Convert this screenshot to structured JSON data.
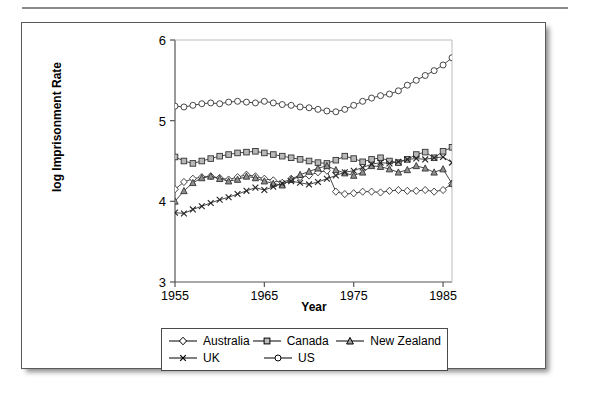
{
  "figure": {
    "has_top_rule": true,
    "frame_color": "#5a5a5a"
  },
  "chart_data": {
    "type": "line",
    "title": "",
    "xlabel": "Year",
    "ylabel": "log Imprisonment Rate",
    "xlim": [
      1955,
      1986
    ],
    "ylim": [
      3,
      6
    ],
    "xticks": [
      1955,
      1965,
      1975,
      1985
    ],
    "yticks": [
      3,
      4,
      5,
      6
    ],
    "xtick_labels": [
      "1955",
      "1965",
      "1975",
      "1985"
    ],
    "ytick_labels": [
      "3",
      "4",
      "5",
      "6"
    ],
    "grid": false,
    "legend_position": "below-plot",
    "x": [
      1955,
      1956,
      1957,
      1958,
      1959,
      1960,
      1961,
      1962,
      1963,
      1964,
      1965,
      1966,
      1967,
      1968,
      1969,
      1970,
      1971,
      1972,
      1973,
      1974,
      1975,
      1976,
      1977,
      1978,
      1979,
      1980,
      1981,
      1982,
      1983,
      1984,
      1985,
      1986
    ],
    "series": [
      {
        "name": "Australia",
        "marker": "diamond",
        "values": [
          4.15,
          4.24,
          4.28,
          4.3,
          4.31,
          4.29,
          4.27,
          4.3,
          4.33,
          4.31,
          4.28,
          4.26,
          4.23,
          4.28,
          4.3,
          4.32,
          4.36,
          4.38,
          4.12,
          4.09,
          4.1,
          4.12,
          4.12,
          4.11,
          4.13,
          4.14,
          4.13,
          4.13,
          4.14,
          4.12,
          4.14,
          4.22
        ]
      },
      {
        "name": "Canada",
        "marker": "square",
        "values": [
          4.55,
          4.5,
          4.47,
          4.5,
          4.53,
          4.56,
          4.58,
          4.6,
          4.61,
          4.62,
          4.6,
          4.58,
          4.56,
          4.54,
          4.52,
          4.5,
          4.48,
          4.47,
          4.51,
          4.56,
          4.53,
          4.49,
          4.52,
          4.54,
          4.5,
          4.48,
          4.52,
          4.58,
          4.61,
          4.54,
          4.62,
          4.67
        ]
      },
      {
        "name": "New Zealand",
        "marker": "triangle",
        "values": [
          4.0,
          4.13,
          4.23,
          4.29,
          4.31,
          4.28,
          4.25,
          4.27,
          4.31,
          4.29,
          4.25,
          4.22,
          4.2,
          4.27,
          4.33,
          4.37,
          4.41,
          4.44,
          4.39,
          4.35,
          4.32,
          4.36,
          4.44,
          4.43,
          4.4,
          4.36,
          4.39,
          4.44,
          4.41,
          4.36,
          4.4,
          4.22
        ]
      },
      {
        "name": "UK",
        "marker": "x",
        "values": [
          3.86,
          3.85,
          3.9,
          3.94,
          3.98,
          4.02,
          4.05,
          4.09,
          4.13,
          4.17,
          4.14,
          4.18,
          4.22,
          4.25,
          4.23,
          4.21,
          4.24,
          4.28,
          4.32,
          4.36,
          4.38,
          4.42,
          4.46,
          4.48,
          4.47,
          4.49,
          4.52,
          4.53,
          4.52,
          4.54,
          4.55,
          4.48
        ]
      },
      {
        "name": "US",
        "marker": "circle",
        "values": [
          5.18,
          5.17,
          5.19,
          5.21,
          5.22,
          5.21,
          5.23,
          5.24,
          5.23,
          5.22,
          5.24,
          5.22,
          5.2,
          5.19,
          5.17,
          5.16,
          5.14,
          5.12,
          5.11,
          5.14,
          5.19,
          5.24,
          5.28,
          5.31,
          5.33,
          5.37,
          5.44,
          5.5,
          5.56,
          5.62,
          5.69,
          5.78
        ]
      }
    ]
  },
  "legend": {
    "rows": [
      [
        {
          "label": "Australia",
          "marker": "diamond-marker-icon"
        },
        {
          "label": "Canada",
          "marker": "square-marker-icon"
        },
        {
          "label": "New Zealand",
          "marker": "triangle-marker-icon"
        }
      ],
      [
        {
          "label": "UK",
          "marker": "x-marker-icon"
        },
        {
          "label": "US",
          "marker": "circle-marker-icon"
        }
      ]
    ]
  }
}
